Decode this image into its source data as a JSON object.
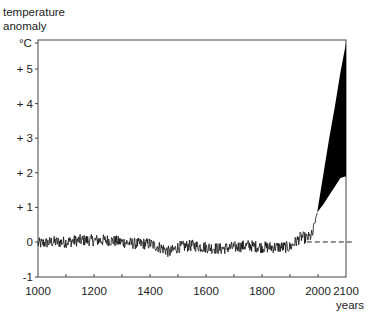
{
  "chart_data": {
    "type": "line",
    "title": "",
    "ylabel": "temperature anomaly",
    "yunit": "°C",
    "xlabel": "years",
    "xlim": [
      1000,
      2100
    ],
    "ylim": [
      -1,
      5.75
    ],
    "x_ticks": [
      1000,
      1100,
      1200,
      1300,
      1400,
      1500,
      1600,
      1700,
      1800,
      1900,
      2000,
      2100
    ],
    "x_tick_labels": [
      "1000",
      "1200",
      "1400",
      "1600",
      "1800",
      "2000",
      "2100"
    ],
    "x_tick_label_values": [
      1000,
      1200,
      1400,
      1600,
      1800,
      2000,
      2100
    ],
    "y_ticks": [
      -1,
      0,
      1,
      2,
      3,
      4,
      5
    ],
    "y_tick_labels": [
      "-1",
      "0",
      "+ 1",
      "+ 2",
      "+ 3",
      "+ 4",
      "+ 5"
    ],
    "grid": false,
    "legend": null,
    "reference_line": {
      "y": 0,
      "style": "dashed",
      "from_year": 1960,
      "to_year": 2130
    },
    "series": [
      {
        "name": "reconstructed/observed temperature anomaly",
        "style": "noisy line",
        "x": [
          1000,
          1050,
          1100,
          1150,
          1200,
          1250,
          1300,
          1350,
          1400,
          1450,
          1470,
          1500,
          1550,
          1600,
          1650,
          1700,
          1750,
          1800,
          1850,
          1900,
          1920,
          1940,
          1960,
          1980,
          1997
        ],
        "values": [
          -0.05,
          0.0,
          0.0,
          0.05,
          0.05,
          0.05,
          0.0,
          -0.05,
          -0.05,
          -0.2,
          -0.3,
          -0.15,
          -0.1,
          -0.15,
          -0.2,
          -0.15,
          -0.1,
          -0.15,
          -0.15,
          -0.15,
          0.0,
          0.15,
          0.1,
          0.2,
          0.85
        ],
        "noise_amplitude": 0.17
      },
      {
        "name": "projection range (upper)",
        "style": "filled band upper bound",
        "x": [
          1997,
          2020,
          2040,
          2060,
          2080,
          2100
        ],
        "values": [
          0.85,
          2.0,
          3.0,
          3.9,
          4.9,
          5.75
        ]
      },
      {
        "name": "projection range (lower)",
        "style": "filled band lower bound",
        "x": [
          1997,
          2020,
          2040,
          2060,
          2080,
          2100
        ],
        "values": [
          0.85,
          1.1,
          1.35,
          1.6,
          1.85,
          1.9
        ]
      }
    ]
  },
  "axes": {
    "y_title_line1": "temperature",
    "y_title_line2": "anomaly",
    "y_unit": "°C",
    "x_title": "years"
  },
  "colors": {
    "line": "#111111",
    "fill": "#000000",
    "axis": "#333333",
    "background": "#ffffff"
  }
}
